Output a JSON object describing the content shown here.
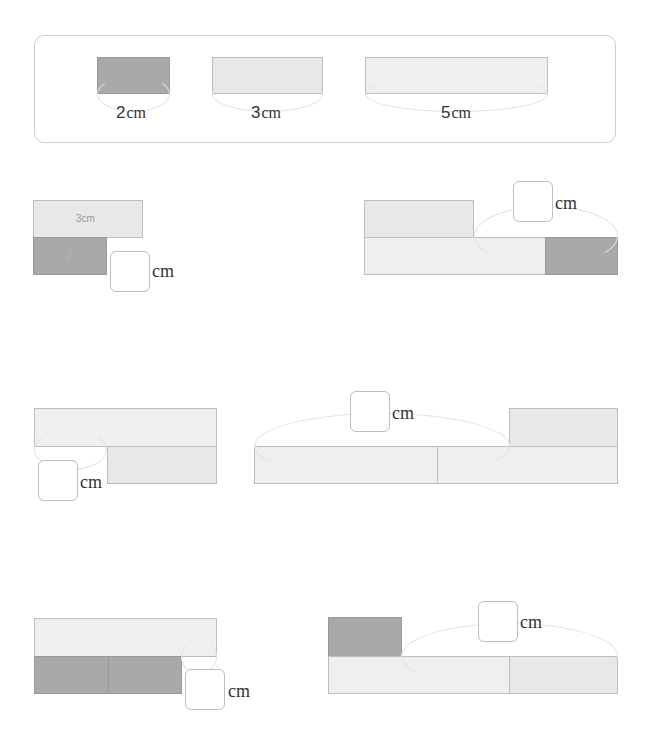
{
  "legend": {
    "items": [
      {
        "length": "2",
        "unit": "cm",
        "color": "#a9a9a9"
      },
      {
        "length": "3",
        "unit": "cm",
        "color": "#e8e8e8"
      },
      {
        "length": "5",
        "unit": "cm",
        "color": "#efefef"
      }
    ]
  },
  "problems": [
    {
      "id": 1,
      "inner_labels": [
        "3cm",
        "2"
      ],
      "unit": "cm",
      "answer": ""
    },
    {
      "id": 2,
      "unit": "cm",
      "answer": ""
    },
    {
      "id": 3,
      "unit": "cm",
      "answer": ""
    },
    {
      "id": 4,
      "unit": "cm",
      "answer": ""
    },
    {
      "id": 5,
      "unit": "cm",
      "answer": ""
    },
    {
      "id": 6,
      "unit": "cm",
      "answer": ""
    }
  ]
}
